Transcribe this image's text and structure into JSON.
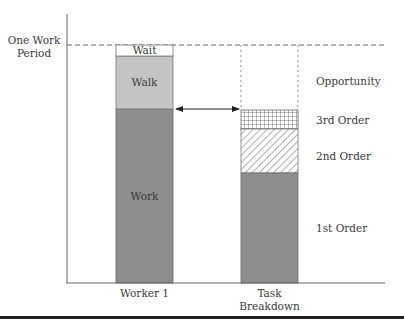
{
  "diagram": {
    "y_axis_label": "One Work Period",
    "y_axis_label_lines": [
      "One Work",
      "Period"
    ],
    "bars": [
      {
        "name": "Worker 1",
        "label_lines": [
          "Worker 1"
        ],
        "segments": [
          {
            "name": "Work",
            "label": "Work",
            "fill": "#8e8e8e",
            "pattern": "solid"
          },
          {
            "name": "Walk",
            "label": "Walk",
            "fill": "#c4c4c4",
            "pattern": "solid"
          },
          {
            "name": "Wait",
            "label": "Wait",
            "fill": "#ffffff",
            "pattern": "solid"
          }
        ]
      },
      {
        "name": "Task Breakdown",
        "label_lines": [
          "Task",
          "Breakdown"
        ],
        "segments": [
          {
            "name": "1st Order",
            "label": "1st Order",
            "fill": "#8e8e8e",
            "pattern": "solid"
          },
          {
            "name": "2nd Order",
            "label": "2nd Order",
            "fill": "#ffffff",
            "pattern": "diagonal-hatch"
          },
          {
            "name": "3rd Order",
            "label": "3rd Order",
            "fill": "#ffffff",
            "pattern": "grid-hatch"
          },
          {
            "name": "Opportunity",
            "label": "Opportunity",
            "fill": "none",
            "pattern": "dashed-outline"
          }
        ]
      }
    ],
    "arrow": {
      "type": "double-headed",
      "from": "Worker 1 work top",
      "to": "Task Breakdown 3rd order top"
    },
    "reference_line": {
      "style": "dashed",
      "meaning": "One Work Period"
    },
    "colors": {
      "axis": "#555555",
      "dark_fill": "#8e8e8e",
      "light_fill": "#c4c4c4",
      "bottom_rule": "#222222"
    }
  }
}
